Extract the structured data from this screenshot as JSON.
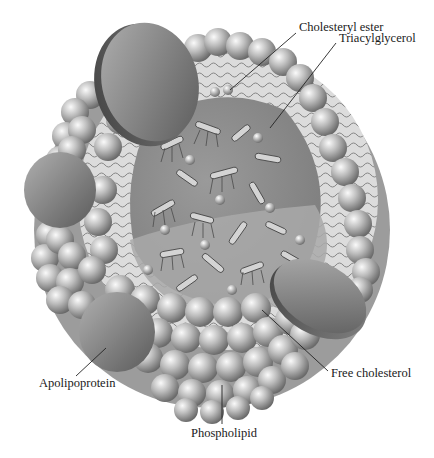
{
  "figure": {
    "background": "#ffffff"
  },
  "labels": {
    "cholesteryl_ester": {
      "text": "Cholesteryl ester",
      "x": 299,
      "y": 28
    },
    "triacylglycerol": {
      "text": "Triacylglycerol",
      "x": 339,
      "y": 38
    },
    "apolipoprotein": {
      "text": "Apolipoprotein",
      "x": 39,
      "y": 377
    },
    "free_cholesterol": {
      "text": "Free cholesterol",
      "x": 330,
      "y": 372
    },
    "phospholipid": {
      "text": "Phospholipid",
      "x": 191,
      "y": 426
    }
  },
  "colors": {
    "sphere_light": "#f2f2f2",
    "sphere_mid": "#b5b5b5",
    "sphere_dark": "#6e6e6e",
    "disc_light": "#a8a8a8",
    "disc_dark": "#5e5e5e",
    "core_fill": "#8f8f8f",
    "core_lower": "#a7a7a7",
    "tail_region": "#d9d9d9",
    "leader_line": "#222222"
  }
}
